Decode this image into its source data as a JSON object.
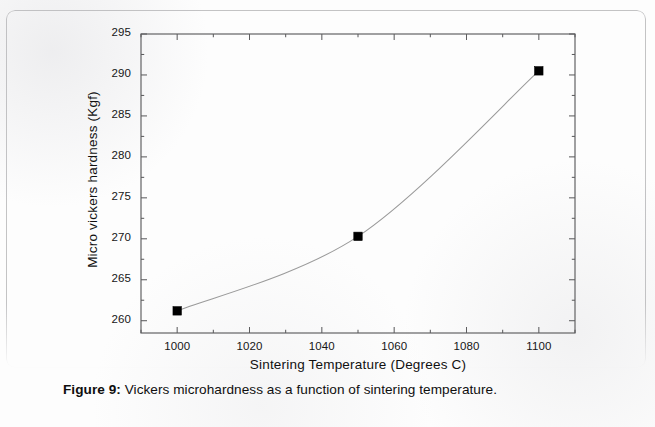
{
  "figure": {
    "caption_label": "Figure 9:",
    "caption_text": "Vickers microhardness as a function of sintering temperature."
  },
  "chart_data": {
    "type": "line",
    "title": "",
    "subtitle": "",
    "xlabel": "Sintering Temperature (Degrees C)",
    "ylabel": "Micro vickers hardness (Kgf)",
    "x": [
      1000,
      1050,
      1100
    ],
    "values": [
      261.2,
      270.3,
      290.5
    ],
    "series": [
      {
        "name": "Micro vickers hardness",
        "x": [
          1000,
          1050,
          1100
        ],
        "values": [
          261.2,
          270.3,
          290.5
        ],
        "marker": "filled-square",
        "marker_color": "#000000",
        "line_color": "#9a9a9a",
        "line_style": "smooth-thin"
      }
    ],
    "xlim": [
      990,
      1110
    ],
    "ylim": [
      258.5,
      295
    ],
    "x_ticks": [
      1000,
      1020,
      1040,
      1060,
      1080,
      1100
    ],
    "x_tick_labels": [
      "1000",
      "1020",
      "1040",
      "1060",
      "1080",
      "1100"
    ],
    "x_minor_step": 10,
    "y_ticks": [
      260,
      265,
      270,
      275,
      280,
      285,
      290,
      295
    ],
    "y_tick_labels": [
      "260",
      "265",
      "270",
      "275",
      "280",
      "285",
      "290",
      "295"
    ],
    "y_minor_step": 2.5,
    "grid": false,
    "legend": null,
    "legend_position": "none",
    "tick_direction": "in",
    "frame": "box-all-sides",
    "annotations": []
  }
}
